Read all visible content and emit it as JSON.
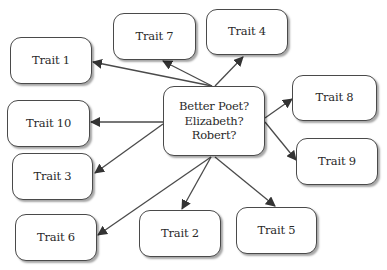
{
  "diagram": {
    "type": "mind-map",
    "top_fragment": "",
    "center": {
      "lines": [
        "Better Poet?",
        "Elizabeth?",
        "Robert?"
      ],
      "box": {
        "x": 163,
        "y": 86,
        "w": 102,
        "h": 70
      }
    },
    "nodes": [
      {
        "id": "trait-1",
        "label": "Trait 1",
        "box": {
          "x": 10,
          "y": 37,
          "w": 82,
          "h": 47
        }
      },
      {
        "id": "trait-2",
        "label": "Trait 2",
        "box": {
          "x": 139,
          "y": 210,
          "w": 82,
          "h": 47
        }
      },
      {
        "id": "trait-3",
        "label": "Trait 3",
        "box": {
          "x": 12,
          "y": 153,
          "w": 81,
          "h": 47
        }
      },
      {
        "id": "trait-4",
        "label": "Trait 4",
        "box": {
          "x": 206,
          "y": 9,
          "w": 82,
          "h": 46
        }
      },
      {
        "id": "trait-5",
        "label": "Trait 5",
        "box": {
          "x": 236,
          "y": 207,
          "w": 81,
          "h": 47
        }
      },
      {
        "id": "trait-6",
        "label": "Trait 6",
        "box": {
          "x": 15,
          "y": 214,
          "w": 82,
          "h": 47
        }
      },
      {
        "id": "trait-7",
        "label": "Trait 7",
        "box": {
          "x": 113,
          "y": 13,
          "w": 83,
          "h": 47
        }
      },
      {
        "id": "trait-8",
        "label": "Trait 8",
        "box": {
          "x": 292,
          "y": 75,
          "w": 85,
          "h": 46
        }
      },
      {
        "id": "trait-9",
        "label": "Trait 9",
        "box": {
          "x": 296,
          "y": 138,
          "w": 82,
          "h": 47
        }
      },
      {
        "id": "trait-10",
        "label": "Trait 10",
        "box": {
          "x": 7,
          "y": 100,
          "w": 83,
          "h": 47
        }
      }
    ],
    "edges": [
      {
        "to": "trait-1",
        "from_pt": [
          212,
          86
        ],
        "to_pt": [
          93,
          62
        ]
      },
      {
        "to": "trait-7",
        "from_pt": [
          212,
          86
        ],
        "to_pt": [
          163,
          61
        ]
      },
      {
        "to": "trait-4",
        "from_pt": [
          215,
          86
        ],
        "to_pt": [
          243,
          57
        ]
      },
      {
        "to": "trait-10",
        "from_pt": [
          163,
          122
        ],
        "to_pt": [
          91,
          122
        ]
      },
      {
        "to": "trait-3",
        "from_pt": [
          163,
          124
        ],
        "to_pt": [
          95,
          173
        ]
      },
      {
        "to": "trait-6",
        "from_pt": [
          211,
          157
        ],
        "to_pt": [
          98,
          235
        ]
      },
      {
        "to": "trait-2",
        "from_pt": [
          211,
          157
        ],
        "to_pt": [
          182,
          209
        ]
      },
      {
        "to": "trait-5",
        "from_pt": [
          215,
          157
        ],
        "to_pt": [
          275,
          206
        ]
      },
      {
        "to": "trait-8",
        "from_pt": [
          265,
          118
        ],
        "to_pt": [
          292,
          99
        ]
      },
      {
        "to": "trait-9",
        "from_pt": [
          265,
          122
        ],
        "to_pt": [
          296,
          160
        ]
      }
    ],
    "colors": {
      "stroke": "#4a4a4a",
      "text": "#2a2a2a",
      "fill": "#ffffff"
    }
  }
}
